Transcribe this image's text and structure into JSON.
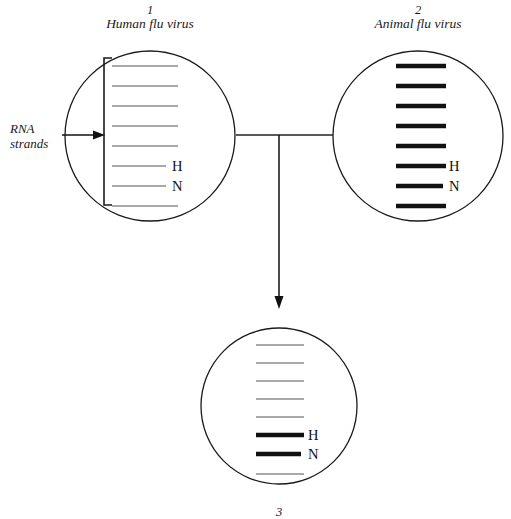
{
  "diagram": {
    "title_visible": false,
    "background_color": "#ffffff",
    "line_color": "#1a1a1a",
    "thin_strand_color": "#555555",
    "thick_strand_color": "#111111",
    "annotation": {
      "rna_label_line1": "RNA",
      "rna_label_line2": "strands",
      "rna_arrow_name": "rna-strands-arrow"
    },
    "viruses": [
      {
        "id": "virus-1",
        "number": "1",
        "name": "Human flu virus",
        "center": {
          "x": 150,
          "y": 136
        },
        "radius": 85,
        "has_bracket": true,
        "strand_x_start": 112,
        "strand_x_end": 178,
        "strands": [
          {
            "index": 1,
            "y": 66,
            "style": "thin",
            "label": ""
          },
          {
            "index": 2,
            "y": 86,
            "style": "thin",
            "label": ""
          },
          {
            "index": 3,
            "y": 106,
            "style": "thin",
            "label": ""
          },
          {
            "index": 4,
            "y": 126,
            "style": "thin",
            "label": ""
          },
          {
            "index": 5,
            "y": 146,
            "style": "thin",
            "label": ""
          },
          {
            "index": 6,
            "y": 166,
            "style": "thin",
            "label": "H"
          },
          {
            "index": 7,
            "y": 186,
            "style": "thin",
            "label": "N"
          },
          {
            "index": 8,
            "y": 206,
            "style": "thin",
            "label": ""
          }
        ]
      },
      {
        "id": "virus-2",
        "number": "2",
        "name": "Animal flu virus",
        "center": {
          "x": 418,
          "y": 136
        },
        "radius": 85,
        "has_bracket": false,
        "strand_x_start": 396,
        "strand_x_end": 446,
        "strands": [
          {
            "index": 1,
            "y": 66,
            "style": "thick",
            "label": ""
          },
          {
            "index": 2,
            "y": 86,
            "style": "thick",
            "label": ""
          },
          {
            "index": 3,
            "y": 106,
            "style": "thick",
            "label": ""
          },
          {
            "index": 4,
            "y": 126,
            "style": "thick",
            "label": ""
          },
          {
            "index": 5,
            "y": 146,
            "style": "thick",
            "label": ""
          },
          {
            "index": 6,
            "y": 166,
            "style": "thick",
            "label": "H"
          },
          {
            "index": 7,
            "y": 186,
            "style": "thick",
            "label": "N"
          },
          {
            "index": 8,
            "y": 206,
            "style": "thick",
            "label": ""
          }
        ]
      },
      {
        "id": "virus-3",
        "number": "3",
        "name": "",
        "center": {
          "x": 279,
          "y": 406
        },
        "radius": 78,
        "has_bracket": false,
        "strand_x_start": 256,
        "strand_x_end": 304,
        "strands": [
          {
            "index": 1,
            "y": 345,
            "style": "thin",
            "label": ""
          },
          {
            "index": 2,
            "y": 363,
            "style": "thin",
            "label": ""
          },
          {
            "index": 3,
            "y": 381,
            "style": "thin",
            "label": ""
          },
          {
            "index": 4,
            "y": 399,
            "style": "thin",
            "label": ""
          },
          {
            "index": 5,
            "y": 417,
            "style": "thin",
            "label": ""
          },
          {
            "index": 6,
            "y": 435,
            "style": "thick",
            "label": "H"
          },
          {
            "index": 7,
            "y": 454,
            "style": "thick",
            "label": "N"
          },
          {
            "index": 8,
            "y": 474,
            "style": "thin",
            "label": ""
          }
        ]
      }
    ],
    "connectors": [
      {
        "name": "horizontal-link-virus1-virus2",
        "from": {
          "x": 236,
          "y": 135
        },
        "to": {
          "x": 333,
          "y": 135
        }
      },
      {
        "name": "reassortment-arrow-to-virus3",
        "from": {
          "x": 279,
          "y": 135
        },
        "to": {
          "x": 279,
          "y": 308
        },
        "arrowhead": true
      }
    ]
  }
}
